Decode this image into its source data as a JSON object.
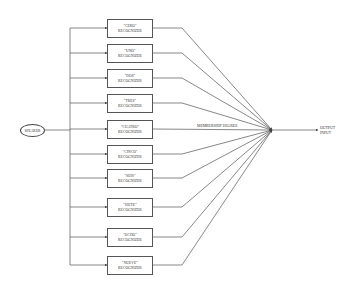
{
  "diagram": {
    "source": {
      "label": "SPEAKER"
    },
    "recognizers": [
      {
        "word": "\"CERO\"",
        "suffix": "RECOGNIZER",
        "top": 19
      },
      {
        "word": "\"UNO\"",
        "suffix": "RECOGNIZER",
        "top": 44
      },
      {
        "word": "\"DOS\"",
        "suffix": "RECOGNIZER",
        "top": 69
      },
      {
        "word": "\"TRES\"",
        "suffix": "RECOGNIZER",
        "top": 94
      },
      {
        "word": "\"CUATRO\"",
        "suffix": "RECOGNIZER",
        "top": 120
      },
      {
        "word": "\"CINCO\"",
        "suffix": "RECOGNIZER",
        "top": 145
      },
      {
        "word": "\"SEIS\"",
        "suffix": "RECOGNIZER",
        "top": 169
      },
      {
        "word": "\"SIETE\"",
        "suffix": "RECOGNIZER",
        "top": 198
      },
      {
        "word": "\"OCHO\"",
        "suffix": "RECOGNIZER",
        "top": 228
      },
      {
        "word": "\"NUEVE\"",
        "suffix": "RECOGNIZER",
        "top": 256
      }
    ],
    "edge_label": "MEMBERSHIP DEGREE",
    "output": {
      "line1": "OUTPUT",
      "line2": "INPUT"
    },
    "colors": {
      "line": "#555555",
      "text": "#333333",
      "background": "#ffffff"
    }
  }
}
